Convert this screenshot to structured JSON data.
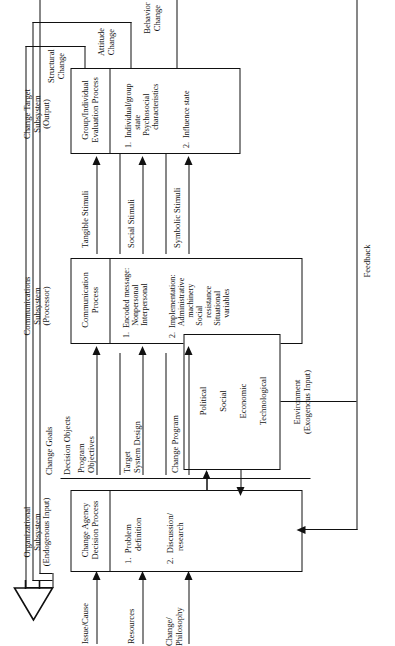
{
  "figure": {
    "orientation": "rotated-90-ccw",
    "ink_color": "#111111",
    "background": "#ffffff"
  },
  "subsystems": {
    "organizational": {
      "header": "Organizational\nSubsystem\n(Endogenous Input)",
      "box_title": "Change Agency\nDecision Process",
      "items": [
        "1.  Problem\n      definition",
        "2.  Discussion/\n      research"
      ]
    },
    "communications": {
      "header": "Communications\nSubsystem\n(Processor)",
      "box_title": "Communication\nProcess",
      "items": [
        "1.  Encoded message:\n      Nonpersonal\n      Interpersonal",
        "2.  Implementation:\n      Administrative\n          machinery\n      Social\n          resistance\n      Situational\n          variables"
      ]
    },
    "change_target": {
      "header": "Change Target\nSubsystem\n(Output)",
      "box_title": "Group/Individual\nEvaluation Process",
      "items": [
        "1.  Individual/group\n         state\n      Psychosocial\n         characteristics",
        "2.  Influence state"
      ]
    },
    "environment": {
      "header": "Environment\n(Exogenous Input)",
      "items": [
        "Political",
        "Social",
        "Economic",
        "Technological"
      ]
    }
  },
  "inputs": {
    "label_group": "left-edge exogenous inputs",
    "items": [
      "Issue/Cause",
      "Resources",
      "Change/\nPhilosophy"
    ]
  },
  "decision_objects": {
    "group_label": "Decision Objects",
    "top_label": "Change Goals",
    "items": [
      "Program\nObjectives",
      "Target\nSystem Design",
      "Change Program"
    ]
  },
  "stimuli": {
    "items": [
      "Tangible Stimuli",
      "Social Stimuli",
      "Symbolic Stimuli"
    ]
  },
  "outputs": {
    "items": [
      "Structural\nChange",
      "Attitude\nChange",
      "Behavior\nChange"
    ]
  },
  "feedback": {
    "label": "Feedback"
  }
}
